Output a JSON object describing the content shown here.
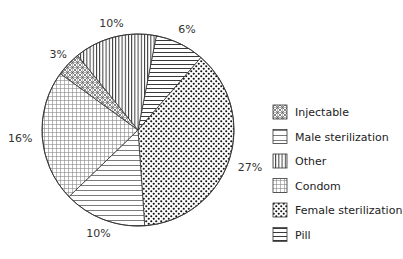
{
  "chart_data": {
    "type": "pie",
    "title": "",
    "start": "top",
    "direction": "clockwise",
    "slices": [
      {
        "key": "pill",
        "label": "Pill",
        "value": 6,
        "display": "6%",
        "pattern": "horizontal-dense"
      },
      {
        "key": "female-sterilization",
        "label": "Female sterilization",
        "value": 27,
        "display": "27%",
        "pattern": "dots"
      },
      {
        "key": "male-sterilization",
        "label": "Male sterilization",
        "value": 10,
        "display": "10%",
        "pattern": "horizontal"
      },
      {
        "key": "condom",
        "label": "Condom",
        "value": 16,
        "display": "16%",
        "pattern": "grid"
      },
      {
        "key": "injectable",
        "label": "Injectable",
        "value": 3,
        "display": "3%",
        "pattern": "crosshatch"
      },
      {
        "key": "other",
        "label": "Other",
        "value": 10,
        "display": "10%",
        "pattern": "vertical"
      }
    ],
    "start_offset_value": 2.2,
    "legend": {
      "placement": "right",
      "order": [
        "injectable",
        "male-sterilization",
        "other",
        "condom",
        "female-sterilization",
        "pill"
      ]
    },
    "colors": {
      "stroke": "#333333",
      "fill": "#ffffff"
    }
  }
}
